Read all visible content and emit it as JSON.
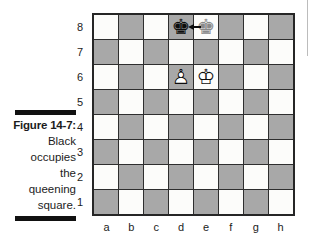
{
  "figure": {
    "label": "Figure 14-7:",
    "caption_lines": [
      "Black",
      "occupies",
      "the",
      "queening",
      "square."
    ]
  },
  "board": {
    "files": [
      "a",
      "b",
      "c",
      "d",
      "e",
      "f",
      "g",
      "h"
    ],
    "ranks": [
      "8",
      "7",
      "6",
      "5",
      "4",
      "3",
      "2",
      "1"
    ],
    "pieces": [
      {
        "square": "d8",
        "name": "black-king",
        "style": "black",
        "glyph": "♚"
      },
      {
        "square": "e8",
        "name": "ghost-black-king",
        "style": "ghost",
        "glyph": "♚"
      },
      {
        "square": "d6",
        "name": "white-pawn",
        "style": "white",
        "glyph": "♙",
        "fill_glyph": "♟"
      },
      {
        "square": "e6",
        "name": "white-king",
        "style": "white",
        "glyph": "♔",
        "fill_glyph": "♚"
      }
    ],
    "arrow": {
      "from": "e8",
      "to": "d8",
      "direction": "left"
    },
    "colors": {
      "light_square": "#fcfcfa",
      "dark_square": "#a8a8a8",
      "grid_line": "#2e2e2e",
      "border": "#262626",
      "ghost_piece": "#8a8a8a"
    }
  },
  "caption_bar_color": "#111111"
}
